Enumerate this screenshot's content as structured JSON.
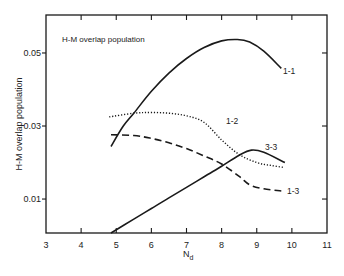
{
  "chart_data": {
    "type": "line",
    "title": "H-M overlap population",
    "xlabel": "N_d",
    "ylabel": "H-M overlap population",
    "xlim": [
      3,
      11
    ],
    "ylim": [
      0.0007,
      0.0604
    ],
    "xticks": [
      3,
      4,
      5,
      6,
      7,
      8,
      9,
      10,
      11
    ],
    "xtick_labels": [
      "3",
      "4",
      "5",
      "6",
      "7",
      "8",
      "9",
      "10",
      "11"
    ],
    "yticks": [
      0.01,
      0.03,
      0.05
    ],
    "ytick_labels": [
      "0.01",
      "0.03",
      "0.05"
    ],
    "grid": false,
    "legend": "inline curve labels",
    "series": [
      {
        "name": "1-1",
        "style": "solid",
        "x": [
          4.85,
          5.2,
          5.5,
          6.0,
          6.5,
          7.0,
          7.5,
          8.0,
          8.45,
          8.8,
          9.2,
          9.7
        ],
        "y": [
          0.0244,
          0.03,
          0.0335,
          0.0395,
          0.0445,
          0.0485,
          0.0515,
          0.0533,
          0.0537,
          0.053,
          0.0505,
          0.0458
        ]
      },
      {
        "name": "1-2",
        "style": "dotted",
        "x": [
          4.8,
          5.5,
          6.0,
          6.5,
          7.0,
          7.5,
          8.0,
          8.5,
          9.0,
          9.4,
          9.75
        ],
        "y": [
          0.0325,
          0.0335,
          0.0337,
          0.0335,
          0.0328,
          0.031,
          0.0262,
          0.0222,
          0.02,
          0.0192,
          0.0187
        ]
      },
      {
        "name": "1-3",
        "style": "dashed",
        "x": [
          4.85,
          5.5,
          6.0,
          6.5,
          7.0,
          7.5,
          8.0,
          8.5,
          8.8,
          9.2,
          9.7
        ],
        "y": [
          0.0276,
          0.0274,
          0.0266,
          0.0254,
          0.0238,
          0.0218,
          0.0196,
          0.0162,
          0.0139,
          0.0128,
          0.0122
        ]
      },
      {
        "name": "3-3",
        "style": "solid",
        "x": [
          4.85,
          5.5,
          6.0,
          6.5,
          7.0,
          7.5,
          8.0,
          8.5,
          8.85,
          9.2,
          9.8
        ],
        "y": [
          0.0007,
          0.0045,
          0.0074,
          0.0103,
          0.0132,
          0.0161,
          0.019,
          0.022,
          0.0234,
          0.0228,
          0.02
        ]
      }
    ],
    "annotations": [
      {
        "text": "1-1",
        "x": 9.75,
        "y": 0.0415
      },
      {
        "text": "1-2",
        "x": 8.65,
        "y": 0.0305
      },
      {
        "text": "3-3",
        "x": 9.1,
        "y": 0.0262
      },
      {
        "text": "1-3",
        "x": 9.95,
        "y": 0.0122
      }
    ]
  },
  "labels": {
    "title": "H-M overlap population",
    "ylabel": "H-M overlap population",
    "xlabel_main": "N",
    "xlabel_sub": "d",
    "curve_1_1": "1-1",
    "curve_1_2": "1-2",
    "curve_1_3": "1-3",
    "curve_3_3": "3-3"
  }
}
